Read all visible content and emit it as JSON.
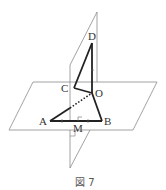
{
  "figure": {
    "caption": "図 7",
    "points": {
      "D": {
        "label": "D",
        "x": 92,
        "y": 43
      },
      "C": {
        "label": "C",
        "x": 74,
        "y": 88
      },
      "O": {
        "label": "O",
        "x": 92,
        "y": 93
      },
      "A": {
        "label": "A",
        "x": 50,
        "y": 121
      },
      "B": {
        "label": "B",
        "x": 102,
        "y": 121
      },
      "M": {
        "label": "M",
        "x": 76,
        "y": 121
      }
    },
    "planes": [
      {
        "name": "horizontal-plane",
        "vertices": [
          [
            33,
            82
          ],
          [
            157,
            82
          ],
          [
            133,
            130
          ],
          [
            9,
            130
          ]
        ]
      },
      {
        "name": "vertical-plane",
        "vertices": [
          [
            97,
            12
          ],
          [
            97,
            130
          ],
          [
            70,
            168
          ],
          [
            70,
            65
          ]
        ]
      }
    ],
    "segments": [
      {
        "from": "C",
        "to": "D",
        "style": "bold"
      },
      {
        "from": "D",
        "to": "O",
        "style": "bold"
      },
      {
        "from": "C",
        "to": "O",
        "style": "bold"
      },
      {
        "from": "O",
        "to": "B",
        "style": "bold"
      },
      {
        "from": "A",
        "to": "B",
        "style": "bold"
      },
      {
        "from": "A",
        "to": "O",
        "style": "dotted-partial"
      }
    ],
    "colors": {
      "line": "#222222",
      "plane": "#888888",
      "label": "#333333"
    }
  }
}
